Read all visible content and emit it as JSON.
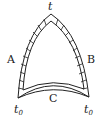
{
  "diagram": {
    "apex_label": "t",
    "left_label": "A",
    "right_label": "B",
    "bottom_label": "C",
    "bottom_left_label": {
      "base": "t",
      "sub": "0"
    },
    "bottom_right_label": {
      "base": "t",
      "sub": "0"
    },
    "colors": {
      "stroke": "#222222",
      "background": "#ffffff"
    }
  }
}
